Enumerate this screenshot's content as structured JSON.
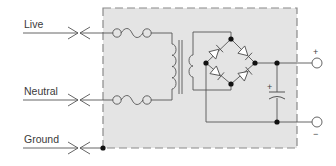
{
  "diagram": {
    "type": "circuit-schematic",
    "inputs": [
      {
        "label": "Live",
        "connector": "plug-contact-icon"
      },
      {
        "label": "Neutral",
        "connector": "plug-contact-icon"
      },
      {
        "label": "Ground",
        "connector": "plug-contact-icon"
      }
    ],
    "outputs": [
      {
        "label": "+",
        "terminal": "output-terminal-positive"
      },
      {
        "label": "−",
        "terminal": "output-terminal-negative"
      }
    ],
    "capacitor_polarity": "+",
    "components": [
      "fuse",
      "fuse",
      "transformer",
      "bridge-rectifier (4 diodes)",
      "electrolytic capacitor"
    ],
    "colors": {
      "enclosure_fill": "#e4e4e4",
      "enclosure_border": "#8a8a8a",
      "wire": "#555555",
      "node": "#111111"
    }
  }
}
